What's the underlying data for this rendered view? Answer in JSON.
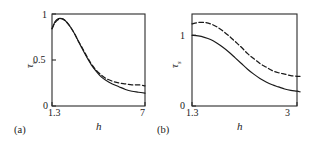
{
  "figure": {
    "panels": [
      {
        "tag": "(a)",
        "xlabel": "h",
        "ylabel": "τ",
        "ylabel_sub": "s",
        "xticklabels": [
          "1.3",
          "7"
        ],
        "yticklabels": [
          "0",
          "0.5",
          "1"
        ]
      },
      {
        "tag": "(b)",
        "xlabel": "h",
        "ylabel": "τ",
        "ylabel_sub": "s",
        "xticklabels": [
          "1.3",
          "3"
        ],
        "yticklabels": [
          "0",
          "1"
        ]
      }
    ]
  },
  "chart_data": [
    {
      "type": "line",
      "title": "",
      "panel": "(a)",
      "xlabel": "h",
      "ylabel": "τs",
      "xlim": [
        1.3,
        7
      ],
      "ylim": [
        0,
        1
      ],
      "xticks": [
        1.3,
        7
      ],
      "yticks": [
        0,
        0.5,
        1
      ],
      "grid": false,
      "legend": "none",
      "series": [
        {
          "name": "solid",
          "style": "solid",
          "color": "#1a1a1a",
          "x": [
            1.3,
            1.5,
            1.7,
            1.9,
            2.1,
            2.3,
            2.5,
            2.7,
            2.9,
            3.1,
            3.4,
            3.7,
            4.0,
            4.3,
            4.6,
            5.0,
            5.4,
            5.8,
            6.2,
            6.6,
            7.0
          ],
          "y": [
            0.84,
            0.92,
            0.95,
            0.95,
            0.93,
            0.89,
            0.84,
            0.78,
            0.71,
            0.64,
            0.54,
            0.45,
            0.38,
            0.32,
            0.28,
            0.24,
            0.21,
            0.18,
            0.16,
            0.15,
            0.14
          ]
        },
        {
          "name": "dashed",
          "style": "dashed",
          "color": "#1a1a1a",
          "x": [
            1.3,
            1.5,
            1.7,
            1.9,
            2.1,
            2.3,
            2.5,
            2.7,
            2.9,
            3.1,
            3.4,
            3.7,
            4.0,
            4.3,
            4.6,
            5.0,
            5.4,
            5.8,
            6.2,
            6.6,
            7.0
          ],
          "y": [
            0.84,
            0.91,
            0.94,
            0.95,
            0.93,
            0.89,
            0.84,
            0.78,
            0.71,
            0.65,
            0.55,
            0.46,
            0.39,
            0.34,
            0.3,
            0.27,
            0.25,
            0.24,
            0.23,
            0.23,
            0.22
          ]
        }
      ]
    },
    {
      "type": "line",
      "title": "",
      "panel": "(b)",
      "xlabel": "h",
      "ylabel": "τs",
      "xlim": [
        1.3,
        3
      ],
      "ylim": [
        0,
        1.3
      ],
      "xticks": [
        1.3,
        3
      ],
      "yticks": [
        0,
        1
      ],
      "grid": false,
      "legend": "none",
      "series": [
        {
          "name": "solid",
          "style": "solid",
          "color": "#1a1a1a",
          "x": [
            1.3,
            1.4,
            1.5,
            1.6,
            1.7,
            1.8,
            1.9,
            2.0,
            2.1,
            2.2,
            2.3,
            2.4,
            2.5,
            2.6,
            2.7,
            2.8,
            2.9,
            3.0,
            3.05
          ],
          "y": [
            1.0,
            0.99,
            0.97,
            0.94,
            0.89,
            0.83,
            0.76,
            0.68,
            0.6,
            0.52,
            0.45,
            0.39,
            0.34,
            0.3,
            0.27,
            0.24,
            0.22,
            0.21,
            0.2
          ]
        },
        {
          "name": "dashed",
          "style": "dashed",
          "color": "#1a1a1a",
          "x": [
            1.3,
            1.4,
            1.5,
            1.6,
            1.7,
            1.8,
            1.9,
            2.0,
            2.1,
            2.2,
            2.3,
            2.4,
            2.5,
            2.6,
            2.7,
            2.8,
            2.9,
            3.0,
            3.05
          ],
          "y": [
            1.16,
            1.18,
            1.18,
            1.16,
            1.12,
            1.06,
            0.99,
            0.91,
            0.83,
            0.74,
            0.67,
            0.6,
            0.55,
            0.5,
            0.47,
            0.45,
            0.43,
            0.42,
            0.42
          ]
        }
      ]
    }
  ]
}
